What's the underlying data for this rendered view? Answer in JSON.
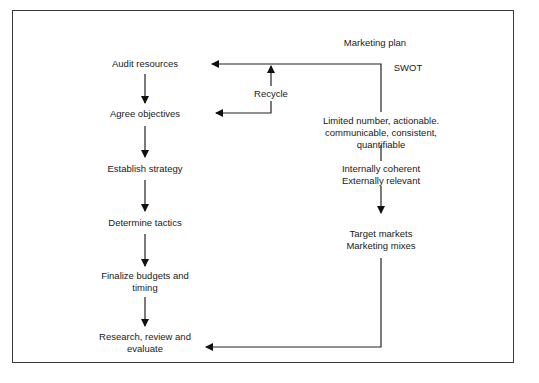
{
  "diagram": {
    "title": "Marketing plan",
    "process_steps": [
      {
        "label": "Audit resources"
      },
      {
        "label": "Agree objectives"
      },
      {
        "label": "Establish strategy"
      },
      {
        "label": "Determine tactics"
      },
      {
        "label": "Finalize budgets and",
        "label2": "timing"
      },
      {
        "label": "Research, review and",
        "label2": "evaluate"
      }
    ],
    "feedback": {
      "recycle_label": "Recycle",
      "swot_label": "SWOT",
      "criteria": [
        "Limited number, actionable.",
        "communicable, consistent,",
        "quantifiable"
      ],
      "coherence": [
        "Internally coherent",
        "Externally relevant"
      ],
      "targets": [
        "Target markets",
        "Marketing mixes"
      ]
    }
  }
}
